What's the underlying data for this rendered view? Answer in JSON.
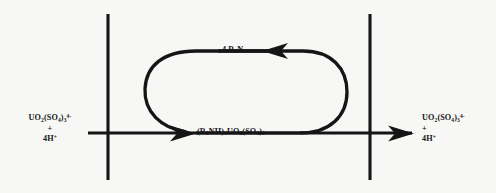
{
  "diagram": {
    "background_color": "#f7f7f5",
    "stroke_color": "#151515",
    "phase_boundaries": [
      {
        "name": "left-phase-boundary",
        "x": 108,
        "y_top": 14,
        "y_bottom": 180
      },
      {
        "name": "right-phase-boundary",
        "x": 370,
        "y_top": 14,
        "y_bottom": 180
      }
    ],
    "reactant_left": {
      "species": "UO",
      "species_sub1": "2",
      "species_mid": "(SO",
      "species_sub2": "4",
      "species_mid2": ")",
      "species_sub3": "3",
      "species_charge": "4-",
      "plus": "+",
      "coreactant": "4H",
      "coreactant_charge": "+"
    },
    "product_right": {
      "species": "UO",
      "species_sub1": "2",
      "species_mid": "(SO",
      "species_sub2": "4",
      "species_mid2": ")",
      "species_sub3": "3",
      "species_charge": "4-",
      "plus": "+",
      "coreactant": "4H",
      "coreactant_charge": "+"
    },
    "center_species": {
      "part1": "(R",
      "sub1": "3",
      "part2": "NH)",
      "sub2": "4",
      "part3": "UO",
      "sub3": "2",
      "part4": "(SO",
      "sub4": "4",
      "part5": ")",
      "sub5": "3"
    },
    "top_reagent": {
      "coefficient": "4 R",
      "sub": "3",
      "element": "N"
    },
    "arrows": [
      {
        "name": "bottom-left-arrow",
        "direction": "right",
        "description": "aqueous reactant enters organic phase forming amine complex"
      },
      {
        "name": "top-arrow",
        "direction": "left",
        "description": "free amine returns toward loading step"
      },
      {
        "name": "bottom-right-arrow",
        "direction": "right",
        "description": "stripped uranyl trisulfate exits to aqueous phase"
      }
    ]
  }
}
